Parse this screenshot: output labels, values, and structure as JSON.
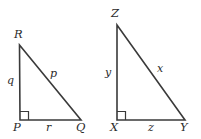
{
  "figure": {
    "background_color": "#ffffff",
    "line_color": "#3a3a3a",
    "label_color": "#2b2b2b",
    "triangles": [
      {
        "name": "triangle-pqr",
        "vertices": [
          {
            "label": "R",
            "x": 19,
            "y": 45,
            "position": "top-left"
          },
          {
            "label": "P",
            "x": 20,
            "y": 120,
            "position": "bottom-left"
          },
          {
            "label": "Q",
            "x": 81,
            "y": 120,
            "position": "bottom-right"
          }
        ],
        "sides": [
          {
            "label": "q",
            "between": "R-P",
            "role": "vertical-leg"
          },
          {
            "label": "p",
            "between": "R-Q",
            "role": "hypotenuse"
          },
          {
            "label": "r",
            "between": "P-Q",
            "role": "horizontal-leg"
          }
        ],
        "right_angle_at": "P"
      },
      {
        "name": "triangle-xyz",
        "vertices": [
          {
            "label": "Z",
            "x": 117,
            "y": 25,
            "position": "top-left"
          },
          {
            "label": "X",
            "x": 117,
            "y": 120,
            "position": "bottom-left"
          },
          {
            "label": "Y",
            "x": 185,
            "y": 120,
            "position": "bottom-right"
          }
        ],
        "sides": [
          {
            "label": "y",
            "between": "Z-X",
            "role": "vertical-leg"
          },
          {
            "label": "x",
            "between": "Z-Y",
            "role": "hypotenuse"
          },
          {
            "label": "z",
            "between": "X-Y",
            "role": "horizontal-leg"
          }
        ],
        "right_angle_at": "X"
      }
    ],
    "labels": {
      "left_vertex_r": "R",
      "left_vertex_p": "P",
      "left_vertex_q": "Q",
      "left_side_q": "q",
      "left_side_p": "p",
      "left_side_r": "r",
      "right_vertex_z": "Z",
      "right_vertex_x": "X",
      "right_vertex_y": "Y",
      "right_side_y": "y",
      "right_side_x": "x",
      "right_side_z": "z"
    }
  }
}
